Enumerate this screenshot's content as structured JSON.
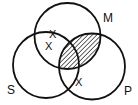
{
  "diagram": {
    "type": "venn",
    "sets": [
      {
        "id": "S",
        "label": "S",
        "cx": 46,
        "cy": 65,
        "r": 33
      },
      {
        "id": "M",
        "label": "M",
        "cx": 67.5,
        "cy": 36,
        "r": 33
      },
      {
        "id": "P",
        "label": "P",
        "cx": 92,
        "cy": 66.5,
        "r": 33
      }
    ],
    "labels": {
      "s": "S",
      "m": "M",
      "p": "P"
    },
    "shaded_region": "M ∩ P",
    "marks": [
      {
        "symbol": "X",
        "region": "S ∩ M boundary",
        "x": 53,
        "y": 34
      },
      {
        "symbol": "X",
        "region": "S ∩ M (not P)",
        "x": 49,
        "y": 46
      },
      {
        "symbol": "X",
        "region": "S ∩ P boundary (not M)",
        "x": 79,
        "y": 82
      }
    ],
    "colors": {
      "stroke": "#111111",
      "background": "#ffffff",
      "hatch": "#111111"
    }
  }
}
